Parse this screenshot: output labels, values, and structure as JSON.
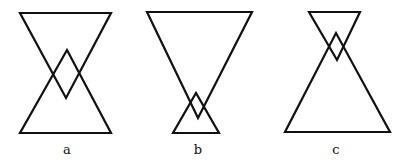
{
  "figures": [
    {
      "label": "a",
      "top_triangle": [
        [
          20,
          13
        ],
        [
          111,
          13
        ],
        [
          66,
          98
        ]
      ],
      "bottom_triangle": [
        [
          20,
          133
        ],
        [
          111,
          133
        ],
        [
          67,
          50
        ]
      ],
      "label_pos": [
        67,
        154
      ]
    },
    {
      "label": "b",
      "top_triangle": [
        [
          147,
          12
        ],
        [
          252,
          12
        ],
        [
          198,
          118
        ]
      ],
      "bottom_triangle": [
        [
          173,
          133
        ],
        [
          219,
          133
        ],
        [
          196,
          93
        ]
      ],
      "label_pos": [
        198,
        154
      ]
    },
    {
      "label": "c",
      "top_triangle": [
        [
          309,
          12
        ],
        [
          360,
          12
        ],
        [
          337,
          60
        ]
      ],
      "bottom_triangle": [
        [
          285,
          132
        ],
        [
          390,
          132
        ],
        [
          336,
          33
        ]
      ],
      "label_pos": [
        336,
        154
      ]
    }
  ],
  "stroke_color": "#111111"
}
